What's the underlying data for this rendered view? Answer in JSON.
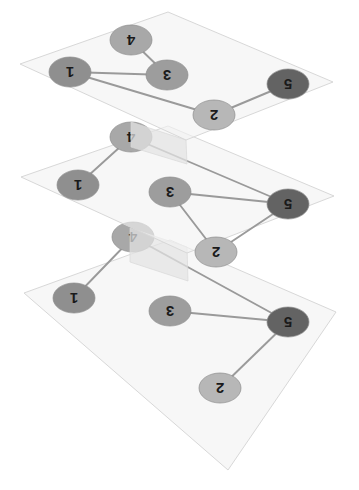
{
  "figure": {
    "title": "",
    "type": "multiplex-network-layers",
    "canvas": {
      "width": 359,
      "height": 490
    },
    "background_color": "#ffffff"
  },
  "style": {
    "plane_fill": "#f2f2f2",
    "plane_fill_opacity": 0.62,
    "plane_stroke": "#d8d8d8",
    "plane_stroke_width": 1,
    "connector_fill": "#e3e3e3",
    "connector_opacity": 0.72,
    "edge_color": "#9a9a9a",
    "edge_width": 1.9,
    "node_stroke": "#8d8d8d",
    "node_stroke_width": 0.7,
    "label_color": "#1a1a1a",
    "label_rotation_deg": 180,
    "node_colors": {
      "1": "#8f8f8f",
      "2": "#b7b7b7",
      "3": "#9d9d9d",
      "4": "#a8a8a8",
      "5": "#636363"
    },
    "node_radius": {
      "rx": 21,
      "ry": 15
    }
  },
  "layers": [
    {
      "id": "layer-top",
      "name": "Layer 1",
      "plane": [
        {
          "x": 20,
          "y": 64
        },
        {
          "x": 168,
          "y": 12
        },
        {
          "x": 333,
          "y": 82
        },
        {
          "x": 186,
          "y": 140
        }
      ],
      "nodes": [
        {
          "id": "4",
          "label": "4",
          "x": 131,
          "y": 40,
          "color": "#a8a8a8"
        },
        {
          "id": "1",
          "label": "1",
          "x": 70,
          "y": 72,
          "color": "#8f8f8f"
        },
        {
          "id": "3",
          "label": "3",
          "x": 167,
          "y": 75,
          "color": "#9d9d9d"
        },
        {
          "id": "2",
          "label": "2",
          "x": 214,
          "y": 115,
          "color": "#b7b7b7"
        },
        {
          "id": "5",
          "label": "5",
          "x": 288,
          "y": 84,
          "color": "#636363"
        }
      ],
      "edges": [
        {
          "from": "4",
          "to": "3"
        },
        {
          "from": "1",
          "to": "3"
        },
        {
          "from": "1",
          "to": "2"
        },
        {
          "from": "2",
          "to": "5"
        }
      ]
    },
    {
      "id": "layer-middle",
      "name": "Layer 2",
      "plane": [
        {
          "x": 21,
          "y": 177
        },
        {
          "x": 168,
          "y": 126
        },
        {
          "x": 334,
          "y": 196
        },
        {
          "x": 187,
          "y": 253
        }
      ],
      "nodes": [
        {
          "id": "4",
          "label": "4",
          "x": 131,
          "y": 137,
          "color": "#a8a8a8"
        },
        {
          "id": "1",
          "label": "1",
          "x": 78,
          "y": 185,
          "color": "#8f8f8f"
        },
        {
          "id": "3",
          "label": "3",
          "x": 170,
          "y": 192,
          "color": "#9d9d9d"
        },
        {
          "id": "2",
          "label": "2",
          "x": 216,
          "y": 252,
          "color": "#b7b7b7"
        },
        {
          "id": "5",
          "label": "5",
          "x": 288,
          "y": 204,
          "color": "#636363"
        }
      ],
      "edges": [
        {
          "from": "1",
          "to": "4"
        },
        {
          "from": "4",
          "to": "5"
        },
        {
          "from": "3",
          "to": "5"
        },
        {
          "from": "3",
          "to": "2"
        },
        {
          "from": "2",
          "to": "5"
        }
      ]
    },
    {
      "id": "layer-bottom",
      "name": "Layer 3",
      "plane": [
        {
          "x": 24,
          "y": 293
        },
        {
          "x": 170,
          "y": 240
        },
        {
          "x": 336,
          "y": 312
        },
        {
          "x": 228,
          "y": 470
        }
      ],
      "nodes": [
        {
          "id": "4",
          "label": "4",
          "x": 133,
          "y": 237,
          "color": "#a8a8a8"
        },
        {
          "id": "1",
          "label": "1",
          "x": 74,
          "y": 298,
          "color": "#8f8f8f"
        },
        {
          "id": "3",
          "label": "3",
          "x": 170,
          "y": 311,
          "color": "#9d9d9d"
        },
        {
          "id": "5",
          "label": "5",
          "x": 288,
          "y": 322,
          "color": "#636363"
        },
        {
          "id": "2",
          "label": "2",
          "x": 220,
          "y": 388,
          "color": "#b7b7b7"
        }
      ],
      "edges": [
        {
          "from": "4",
          "to": "1"
        },
        {
          "from": "4",
          "to": "5"
        },
        {
          "from": "3",
          "to": "5"
        },
        {
          "from": "5",
          "to": "2"
        }
      ]
    }
  ],
  "connectors": [
    {
      "id": "connector-top-middle",
      "from_layer": "layer-top",
      "to_layer": "layer-middle",
      "polygon": [
        {
          "x": 131,
          "y": 122
        },
        {
          "x": 186,
          "y": 140
        },
        {
          "x": 187,
          "y": 164
        },
        {
          "x": 131,
          "y": 147
        }
      ]
    },
    {
      "id": "connector-middle-bottom",
      "from_layer": "layer-middle",
      "to_layer": "layer-bottom",
      "polygon": [
        {
          "x": 130,
          "y": 228
        },
        {
          "x": 187,
          "y": 247
        },
        {
          "x": 188,
          "y": 281
        },
        {
          "x": 130,
          "y": 262
        }
      ]
    }
  ],
  "chart_data": {
    "type": "diagram",
    "node_ids": [
      "1",
      "2",
      "3",
      "4",
      "5"
    ],
    "layer_names": [
      "Layer 1",
      "Layer 2",
      "Layer 3"
    ],
    "edges_per_layer": {
      "Layer 1": [
        [
          "4",
          "3"
        ],
        [
          "1",
          "3"
        ],
        [
          "1",
          "2"
        ],
        [
          "2",
          "5"
        ]
      ],
      "Layer 2": [
        [
          "1",
          "4"
        ],
        [
          "4",
          "5"
        ],
        [
          "3",
          "5"
        ],
        [
          "3",
          "2"
        ],
        [
          "2",
          "5"
        ]
      ],
      "Layer 3": [
        [
          "4",
          "1"
        ],
        [
          "4",
          "5"
        ],
        [
          "3",
          "5"
        ],
        [
          "5",
          "2"
        ]
      ]
    },
    "edge_counts": {
      "Layer 1": 4,
      "Layer 2": 5,
      "Layer 3": 4
    },
    "legend": []
  }
}
